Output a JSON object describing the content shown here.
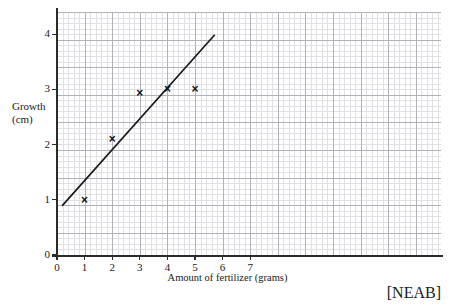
{
  "chart_data": {
    "type": "scatter",
    "title": "",
    "xlabel": "Amount of fertilizer (grams)",
    "ylabel": "Growth (cm)",
    "ylabel_lines": [
      "Growth",
      "(cm)"
    ],
    "xlim": [
      0,
      7.45
    ],
    "ylim": [
      0,
      4.45
    ],
    "xticks": [
      0,
      1,
      2,
      3,
      4,
      5,
      6,
      7
    ],
    "xtick_labels": [
      "0",
      "1",
      "2",
      "3",
      "4",
      "5",
      "6",
      "7"
    ],
    "yticks": [
      0,
      1,
      2,
      3,
      4
    ],
    "ytick_labels": [
      "0",
      "1",
      "2",
      "3",
      "4"
    ],
    "grid": true,
    "grid_minor": true,
    "legend": false,
    "marker": "x",
    "marker_color": "#141414",
    "points": [
      {
        "x": 1,
        "y": 1.0
      },
      {
        "x": 2,
        "y": 2.1
      },
      {
        "x": 3,
        "y": 2.93
      },
      {
        "x": 4,
        "y": 3.0
      },
      {
        "x": 5,
        "y": 3.0
      }
    ],
    "x": [
      1,
      2,
      3,
      4,
      5
    ],
    "y": [
      1.0,
      2.1,
      2.93,
      3.0,
      3.0
    ],
    "trend_line": {
      "label": "line of best fit",
      "color": "#1a1a1a",
      "x_start": 0.2,
      "y_start": 0.9,
      "x_end": 5.7,
      "y_end": 3.98
    },
    "annotations": [
      {
        "name": "source-credit",
        "text": "[NEAB]"
      }
    ],
    "colors": {
      "axis": "#2b2b2b",
      "grid_major": "#a9a9b2",
      "grid_minor": "#d8d8dd",
      "background": "#ffffff",
      "text": "#1a1a1a"
    }
  }
}
